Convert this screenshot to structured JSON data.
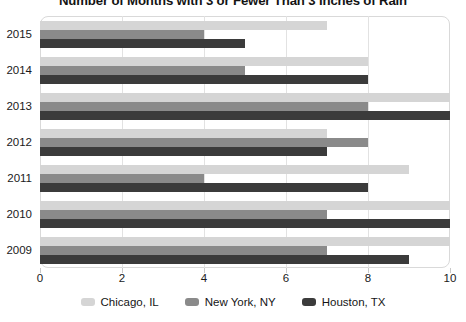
{
  "chart_data": {
    "type": "bar",
    "orientation": "horizontal",
    "title": "Number of Months with 3 or Fewer Than 3 Inches of Rain",
    "xlabel": "",
    "ylabel": "",
    "xlim": [
      0,
      10
    ],
    "xticks": [
      0,
      2,
      4,
      6,
      8,
      10
    ],
    "xtick_labels": [
      "0",
      "2",
      "4",
      "6",
      "8",
      "10"
    ],
    "categories": [
      "2015",
      "2014",
      "2013",
      "2012",
      "2011",
      "2010",
      "2009"
    ],
    "grid": true,
    "legend_position": "bottom",
    "series": [
      {
        "name": "Chicago, IL",
        "color": "#d5d5d5",
        "values": [
          7,
          8,
          10,
          7,
          9,
          10,
          10
        ]
      },
      {
        "name": "New York, NY",
        "color": "#8a8a8a",
        "values": [
          4,
          5,
          8,
          8,
          4,
          7,
          7
        ]
      },
      {
        "name": "Houston, TX",
        "color": "#3b3b3b",
        "values": [
          5,
          8,
          10,
          7,
          8,
          10,
          9
        ]
      }
    ]
  }
}
